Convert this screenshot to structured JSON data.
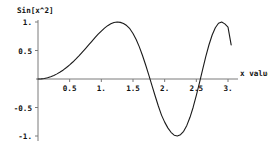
{
  "chart_data": {
    "type": "line",
    "title": "",
    "ylabel": "Sin[x^2]",
    "xlabel": "x value",
    "function_label": "Sin[x^2]",
    "grid": false,
    "legend": false,
    "xlim": [
      0,
      3.15
    ],
    "ylim": [
      -1.1,
      1.1
    ],
    "x_ticks": [
      {
        "value": 0.5,
        "label": "0.5"
      },
      {
        "value": 1.0,
        "label": "1."
      },
      {
        "value": 1.5,
        "label": "1.5"
      },
      {
        "value": 2.0,
        "label": "2."
      },
      {
        "value": 2.5,
        "label": "2.5"
      },
      {
        "value": 3.0,
        "label": "3."
      }
    ],
    "y_ticks": [
      {
        "value": 1.0,
        "label": "1."
      },
      {
        "value": 0.5,
        "label": "0.5"
      },
      {
        "value": -0.5,
        "label": "-0.5"
      },
      {
        "value": -1.0,
        "label": "-1."
      }
    ],
    "series": [
      {
        "name": "Sin[x^2]",
        "color": "#1a1a1a",
        "x": [
          0.0,
          0.05,
          0.1,
          0.15,
          0.2,
          0.25,
          0.3,
          0.35,
          0.4,
          0.45,
          0.5,
          0.55,
          0.6,
          0.65,
          0.7,
          0.75,
          0.8,
          0.85,
          0.9,
          0.95,
          1.0,
          1.05,
          1.1,
          1.15,
          1.2,
          1.25,
          1.3,
          1.35,
          1.4,
          1.45,
          1.5,
          1.55,
          1.6,
          1.65,
          1.7,
          1.75,
          1.8,
          1.85,
          1.9,
          1.95,
          2.0,
          2.05,
          2.1,
          2.15,
          2.2,
          2.25,
          2.3,
          2.35,
          2.4,
          2.45,
          2.5,
          2.55,
          2.6,
          2.65,
          2.7,
          2.75,
          2.8,
          2.85,
          2.9,
          2.95,
          3.0,
          3.05
        ],
        "y": [
          0.0,
          0.0025,
          0.01,
          0.0225,
          0.04,
          0.0625,
          0.0899,
          0.1222,
          0.1593,
          0.2011,
          0.2474,
          0.2979,
          0.3523,
          0.4101,
          0.4706,
          0.5331,
          0.5969,
          0.661,
          0.7243,
          0.7857,
          0.8415,
          0.893,
          0.9358,
          0.9687,
          0.9911,
          1.0,
          0.9936,
          0.9747,
          0.938,
          0.8827,
          0.7985,
          0.6927,
          0.5632,
          0.4129,
          0.2461,
          0.0678,
          -0.116,
          -0.2987,
          -0.4736,
          -0.6337,
          -0.7568,
          -0.8573,
          -0.9351,
          -0.9864,
          -0.9999,
          -0.9779,
          -0.9183,
          -0.8139,
          -0.672,
          -0.4951,
          -0.2879,
          -0.0627,
          0.1701,
          0.3969,
          0.6009,
          0.7724,
          0.8992,
          0.9781,
          0.9998,
          0.9672,
          0.9112,
          0.598
        ]
      }
    ]
  },
  "labels": {
    "y_axis_title": "Sin[x^2]",
    "x_axis_title": "x value"
  }
}
